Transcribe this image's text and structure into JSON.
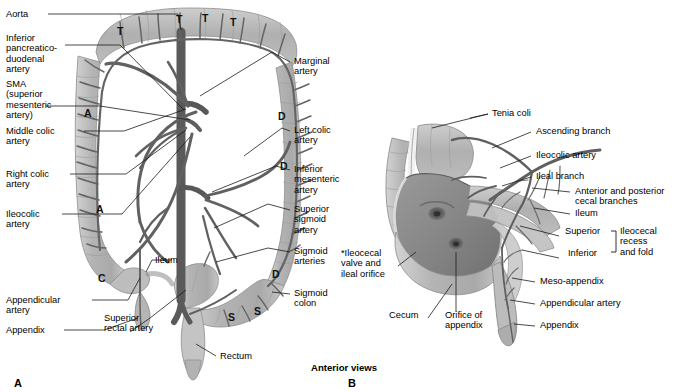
{
  "figure": {
    "caption": "Anterior views",
    "panels": [
      {
        "id": "A",
        "letter": "A"
      },
      {
        "id": "B",
        "letter": "B"
      }
    ]
  },
  "panelA": {
    "letter": "A",
    "labels_left": [
      {
        "name": "aorta",
        "text": "Aorta"
      },
      {
        "name": "inferior-pancreaticoduodenal-artery",
        "text": "Inferior\npancreatico-\nduodenal\nartery"
      },
      {
        "name": "sma",
        "text": "SMA\n(superior\nmesenteric\nartery)"
      },
      {
        "name": "middle-colic-artery",
        "text": "Middle colic\nartery"
      },
      {
        "name": "right-colic-artery",
        "text": "Right colic\nartery"
      },
      {
        "name": "ileocolic-artery",
        "text": "Ileocolic\nartery"
      },
      {
        "name": "appendicular-artery",
        "text": "Appendicular\nartery"
      },
      {
        "name": "appendix",
        "text": "Appendix"
      }
    ],
    "labels_right": [
      {
        "name": "marginal-artery",
        "text": "Marginal\nartery"
      },
      {
        "name": "left-colic-artery",
        "text": "Left colic\nartery"
      },
      {
        "name": "inferior-mesenteric-artery",
        "text": "Inferior\nmesenteric\nartery"
      },
      {
        "name": "superior-sigmoid-artery",
        "text": "Superior\nsigmoid\nartery"
      },
      {
        "name": "sigmoid-arteries",
        "text": "Sigmoid\narteries"
      },
      {
        "name": "sigmoid-colon",
        "text": "Sigmoid\ncolon"
      }
    ],
    "labels_inner": [
      {
        "name": "ileum",
        "text": "Ileum"
      },
      {
        "name": "superior-rectal-artery",
        "text": "Superior\nrectal artery"
      },
      {
        "name": "rectum",
        "text": "Rectum"
      }
    ],
    "markers": [
      {
        "name": "marker-t-1",
        "text": "T"
      },
      {
        "name": "marker-t-2",
        "text": "T"
      },
      {
        "name": "marker-t-3",
        "text": "T"
      },
      {
        "name": "marker-t-4",
        "text": "T"
      },
      {
        "name": "marker-a-1",
        "text": "A"
      },
      {
        "name": "marker-a-2",
        "text": "A"
      },
      {
        "name": "marker-c",
        "text": "C"
      },
      {
        "name": "marker-d-1",
        "text": "D"
      },
      {
        "name": "marker-d-2",
        "text": "D"
      },
      {
        "name": "marker-d-3",
        "text": "D"
      },
      {
        "name": "marker-s-1",
        "text": "S"
      },
      {
        "name": "marker-s-2",
        "text": "S"
      }
    ]
  },
  "panelB": {
    "letter": "B",
    "labels_right": [
      {
        "name": "tenia-coli",
        "text": "Tenia coli"
      },
      {
        "name": "ascending-branch",
        "text": "Ascending branch"
      },
      {
        "name": "ileocolic-artery",
        "text": "Ileocolic artery"
      },
      {
        "name": "ileal-branch",
        "text": "Ileal branch"
      },
      {
        "name": "anterior-posterior-cecal-branches",
        "text": "Anterior and posterior\ncecal branches"
      },
      {
        "name": "ileum",
        "text": "Ileum"
      },
      {
        "name": "meso-appendix",
        "text": "Meso-appendix"
      },
      {
        "name": "appendicular-artery",
        "text": "Appendicular artery"
      },
      {
        "name": "appendix",
        "text": "Appendix"
      }
    ],
    "bracket": {
      "name": "ileocecal-recess-bracket",
      "superior": "Superior",
      "inferior": "Inferior",
      "group": "Ileocecal\nrecess\nand fold"
    },
    "labels_left": [
      {
        "name": "ileocecal-valve-and-ileal-orifice",
        "text": "*Ileocecal\nvalve and\nileal orifice"
      },
      {
        "name": "cecum",
        "text": "Cecum"
      },
      {
        "name": "orifice-of-appendix",
        "text": "Orifice of\nappendix"
      }
    ]
  },
  "colors": {
    "artery": "#5f5f5f",
    "artery_dark": "#4a4a4a",
    "bowel_fill": "#b9b9b9",
    "bowel_fill_light": "#cfcfcf",
    "bowel_stroke": "#8a8a8a",
    "mucosa": "#8e8e8e",
    "leader": "#1a1a1a",
    "background": "#ffffff"
  }
}
